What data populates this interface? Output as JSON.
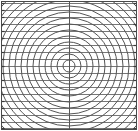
{
  "figure": {
    "title": "",
    "background_color": "#ffffff",
    "width": 138,
    "height": 131,
    "border": {
      "visible": true,
      "color": "#4a4a4a",
      "width": 1,
      "inset": 1
    }
  },
  "chart_data": {
    "type": "line",
    "title": "",
    "subtitle": "",
    "xlabel": "",
    "ylabel": "",
    "grid": true,
    "legend": null,
    "center": {
      "x": 69,
      "y": 66
    },
    "xlim": [
      0,
      138
    ],
    "ylim": [
      0,
      131
    ],
    "series": [
      {
        "name": "concentric-rings",
        "kind": "circles",
        "color": "#555555",
        "linewidth": 1.0,
        "radii": [
          6,
          12,
          18,
          24,
          30,
          36,
          42,
          48,
          54,
          60,
          66,
          72,
          78,
          84,
          90,
          96,
          102,
          108,
          114,
          120,
          126
        ]
      },
      {
        "name": "horizontal-gridlines",
        "kind": "hlines",
        "color": "#777777",
        "linewidth": 1.0,
        "values": [
          3,
          10,
          17,
          24,
          31,
          38,
          45,
          52,
          59,
          66,
          73,
          80,
          87,
          94,
          101,
          108,
          115,
          122,
          128
        ]
      },
      {
        "name": "vertical-centerline",
        "kind": "vlines",
        "color": "#555555",
        "linewidth": 1.0,
        "values": [
          69
        ]
      }
    ],
    "xticks": [],
    "xticklabels": [],
    "yticks": [
      3,
      10,
      17,
      24,
      31,
      38,
      45,
      52,
      59,
      66,
      73,
      80,
      87,
      94,
      101,
      108,
      115,
      122,
      128
    ],
    "yticklabels": [],
    "tickmarks": {
      "visible": true,
      "color": "#3a3a3a",
      "length": 3,
      "sides": [
        "left",
        "right"
      ]
    }
  }
}
